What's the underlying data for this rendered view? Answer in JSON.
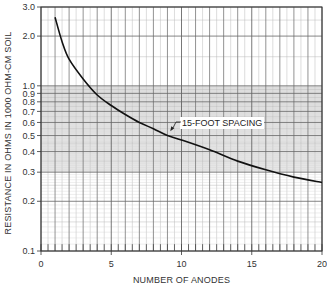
{
  "chart_data": {
    "type": "line",
    "title": "",
    "xlabel": "NUMBER OF ANODES",
    "ylabel": "RESISTANCE IN OHMS IN 1000 OHM-CM SOIL",
    "xlim": [
      0,
      20
    ],
    "ylim": [
      0.1,
      3.0
    ],
    "yscale": "log",
    "grid": true,
    "x_ticks": [
      0,
      5,
      10,
      15,
      20
    ],
    "x_tick_labels": [
      "0",
      "5",
      "10",
      "15",
      "20"
    ],
    "y_ticks": [
      3.0,
      2.0,
      1.0,
      0.9,
      0.8,
      0.7,
      0.6,
      0.5,
      0.4,
      0.3,
      0.2,
      0.1
    ],
    "y_tick_labels": [
      "3.0",
      "2.0",
      "1.0",
      "0.9",
      "0.8",
      "0.7",
      "0.6",
      "0.5",
      "0.4",
      "0.3",
      "0.2",
      "0.1"
    ],
    "shaded_band": {
      "y_from": 0.3,
      "y_to": 1.0
    },
    "series": [
      {
        "name": "15-FOOT SPACING",
        "x": [
          1,
          1.5,
          2,
          3,
          4,
          5,
          6,
          7,
          8,
          9,
          10,
          12,
          14,
          16,
          18,
          20
        ],
        "values": [
          2.6,
          1.85,
          1.45,
          1.1,
          0.88,
          0.76,
          0.67,
          0.6,
          0.55,
          0.5,
          0.47,
          0.41,
          0.35,
          0.31,
          0.28,
          0.26
        ]
      }
    ],
    "annotations": [
      {
        "text": "15-FOOT SPACING",
        "points_to": {
          "x": 9.2,
          "y": 0.53
        }
      }
    ]
  }
}
